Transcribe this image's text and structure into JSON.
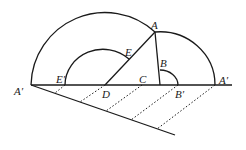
{
  "diagram": {
    "type": "geometric-construction",
    "labels": {
      "A": "A",
      "A_prime_left": "A′",
      "A_prime_right": "A′",
      "B": "B",
      "B_prime": "B′",
      "C": "C",
      "D": "D",
      "E": "E",
      "E_prime": "E′"
    }
  }
}
